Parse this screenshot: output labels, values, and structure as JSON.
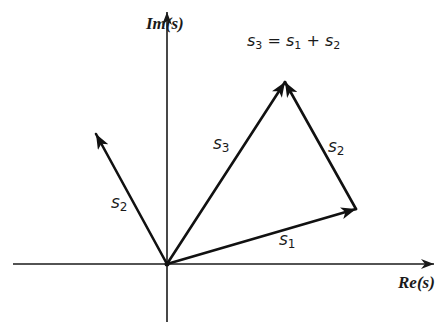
{
  "diagram": {
    "type": "vector-addition-complex-plane",
    "axes": {
      "horizontal_label": "Re(s)",
      "vertical_label": "Im(s)"
    },
    "equation": {
      "lhs_base": "s",
      "lhs_sub": "3",
      "op_eq": "=",
      "t1_base": "s",
      "t1_sub": "1",
      "op_plus": "+",
      "t2_base": "s",
      "t2_sub": "2"
    },
    "vectors": [
      {
        "id": "s1",
        "base": "s",
        "sub": "1",
        "from": "origin",
        "to": "s1-tip"
      },
      {
        "id": "s2-origin",
        "base": "s",
        "sub": "2",
        "from": "origin",
        "to": "s2-tip"
      },
      {
        "id": "s3",
        "base": "s",
        "sub": "3",
        "from": "origin",
        "to": "s3-tip"
      },
      {
        "id": "s2-translated",
        "base": "s",
        "sub": "2",
        "from": "s1-tip",
        "to": "s3-tip"
      }
    ],
    "colors": {
      "ink": "#111111",
      "background": "#ffffff"
    }
  }
}
